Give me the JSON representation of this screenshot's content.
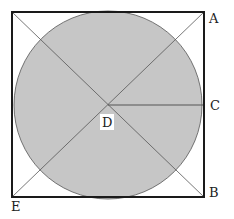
{
  "diagram": {
    "type": "circle-inscribed-in-square",
    "colors": {
      "circle_fill": "#c6c6c6",
      "square_stroke": "#1a1a1a",
      "diagonal_stroke": "#444444",
      "background": "#ffffff"
    },
    "labels": {
      "A": "A",
      "B": "B",
      "C": "C",
      "D": "D",
      "E": "E"
    },
    "points": {
      "A": "top-right corner of square",
      "B": "bottom-right corner of square",
      "C": "point on circle at right side (radius endpoint)",
      "D": "center of circle",
      "E": "bottom-left corner of square"
    },
    "segments": [
      "diagonal top-left to bottom-right",
      "diagonal bottom-left (E) to top-right (A)",
      "radius D to C"
    ]
  }
}
